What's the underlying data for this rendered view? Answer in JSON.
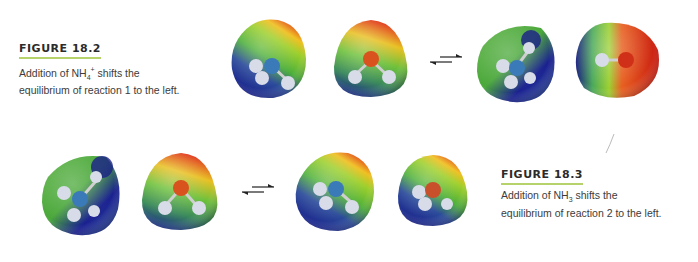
{
  "figures": [
    {
      "title": "FIGURE 18.2",
      "caption_line1_pre": "Addition of NH",
      "caption_line1_sub": "4",
      "caption_line1_sup": "+",
      "caption_line1_post": " shifts the",
      "caption_line2": "equilibrium of reaction 1 to the left.",
      "molecules": [
        "NH4+ electrostatic potential map",
        "H2O electrostatic potential map",
        "NH3 (left-shifted) map",
        "OH- electrostatic potential map"
      ]
    },
    {
      "title": "FIGURE 18.3",
      "caption_line1_pre": "Addition of NH",
      "caption_line1_sub": "3",
      "caption_line1_post": " shifts the",
      "caption_line2": "equilibrium of reaction 2 to the left.",
      "molecules": [
        "NH4+ electrostatic potential map",
        "H2O electrostatic potential map",
        "NH3 electrostatic potential map",
        "H2O electrostatic potential map"
      ]
    }
  ],
  "colors": {
    "accent_underline": "#b5d36a",
    "text": "#3c3c3c"
  }
}
